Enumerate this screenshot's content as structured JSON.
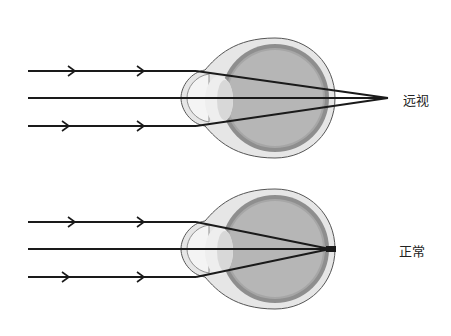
{
  "diagram": {
    "panels": [
      {
        "id": "hyperopia",
        "label": "远视",
        "focus": "behind retina"
      },
      {
        "id": "normal",
        "label": "正常",
        "focus": "on retina"
      }
    ],
    "colors": {
      "ray": "#1a1a1a",
      "sclera": "#e4e4e4",
      "choroid": "#8e8e8e",
      "vitreous": "#b4b4b4",
      "lens": "#efefef",
      "outline": "#555555"
    }
  }
}
